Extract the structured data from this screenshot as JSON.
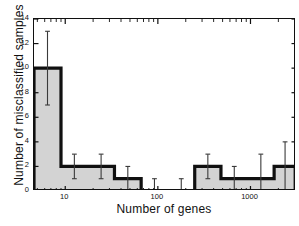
{
  "chart_data": {
    "type": "bar",
    "title": "",
    "xlabel": "Number of genes",
    "ylabel": "Number of misclassified samples",
    "xscale": "log",
    "xlim": [
      4.6,
      3100
    ],
    "ylim": [
      0,
      14
    ],
    "grid": false,
    "legend": null,
    "xtick_labels": [
      "10",
      "100",
      "1000"
    ],
    "xtick_values": [
      10,
      100,
      1000
    ],
    "ytick_labels": [
      "0",
      "2",
      "4",
      "6",
      "8",
      "10",
      "12",
      "14"
    ],
    "ytick_values": [
      0,
      2,
      4,
      6,
      8,
      10,
      12,
      14
    ],
    "bin_edges": [
      4.6,
      9.0,
      17.5,
      34,
      66,
      128,
      250,
      480,
      930,
      1800,
      3100
    ],
    "categories": [
      "4.6-9",
      "9-17.5",
      "17.5-34",
      "34-66",
      "66-128",
      "128-250",
      "250-480",
      "480-930",
      "930-1800",
      "1800-3100"
    ],
    "values": [
      10,
      2,
      2,
      1,
      0,
      0,
      2,
      1,
      1,
      2
    ],
    "error_low": [
      7,
      1,
      1,
      0,
      0,
      0,
      1,
      0,
      0,
      0
    ],
    "error_high": [
      13,
      3,
      3,
      2,
      1,
      1,
      3,
      2,
      3,
      4
    ],
    "bar_fill_color": "#d3d3d3",
    "bar_edge_color": "#101010",
    "errorbar_color": "#3a3a3a",
    "axis_color": "#101010",
    "background_color": "#ffffff"
  }
}
